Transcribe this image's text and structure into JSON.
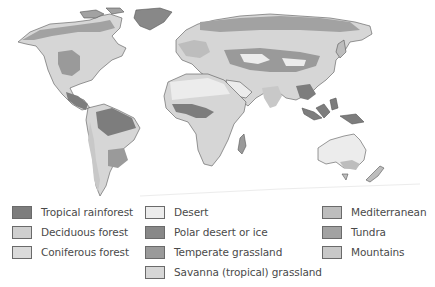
{
  "map": {
    "title": "World biomes",
    "ocean_color": "#ffffff",
    "outline_color": "#555555"
  },
  "legend": {
    "columns": [
      {
        "items": [
          {
            "label": "Tropical rainforest",
            "color": "#7d7d7d"
          },
          {
            "label": "Deciduous forest",
            "color": "#cfcfcf"
          },
          {
            "label": "Coniferous forest",
            "color": "#dadada"
          }
        ]
      },
      {
        "items": [
          {
            "label": "Desert",
            "color": "#ececec"
          },
          {
            "label": "Polar desert or ice",
            "color": "#888888"
          },
          {
            "label": "Temperate grassland",
            "color": "#9a9a9a"
          },
          {
            "label": "Savanna (tropical) grassland",
            "color": "#d6d6d6"
          }
        ]
      },
      {
        "items": [
          {
            "label": "Mediterranean",
            "color": "#bdbdbd"
          },
          {
            "label": "Tundra",
            "color": "#a2a2a2"
          },
          {
            "label": "Mountains",
            "color": "#c8c8c8"
          }
        ]
      }
    ]
  }
}
